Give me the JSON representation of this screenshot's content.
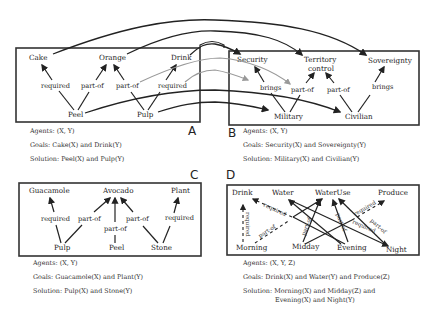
{
  "panels": {
    "A": {
      "letter": "A",
      "nodes": {
        "cake": "Cake",
        "orange": "Orange",
        "drink": "Drink",
        "peel": "Peel",
        "pulp": "Pulp"
      },
      "edges": [
        {
          "from": "Peel",
          "to": "Cake",
          "label": "required"
        },
        {
          "from": "Peel",
          "to": "Orange",
          "label": "part-of"
        },
        {
          "from": "Pulp",
          "to": "Orange",
          "label": "part-of"
        },
        {
          "from": "Pulp",
          "to": "Drink",
          "label": "required"
        }
      ],
      "agents": "Agents: (X, Y)",
      "goals": "Goals: Cake(X) and Drink(Y)",
      "solution": "Solution: Peel(X) and Pulp(Y)"
    },
    "B": {
      "letter": "B",
      "nodes": {
        "security": "Security",
        "territory_line1": "Territory",
        "territory_line2": "control",
        "sovereignty": "Sovereignty",
        "military": "Military",
        "civilian": "Civilian"
      },
      "edges": [
        {
          "from": "Military",
          "to": "Security",
          "label": "brings"
        },
        {
          "from": "Military",
          "to": "Territory control",
          "label": "part-of"
        },
        {
          "from": "Civilian",
          "to": "Territory control",
          "label": "part-of"
        },
        {
          "from": "Civilian",
          "to": "Sovereignty",
          "label": "brings"
        }
      ],
      "agents": "Agents: (X, Y)",
      "goals": "Goals: Security(X) and Sovereignty(Y)",
      "solution": "Solution: Military(X) and Civilian(Y)"
    },
    "C": {
      "letter": "C",
      "nodes": {
        "guacamole": "Guacamole",
        "avocado": "Avocado",
        "plant": "Plant",
        "pulp": "Pulp",
        "peel": "Peel",
        "stone": "Stone"
      },
      "edges": [
        {
          "from": "Pulp",
          "to": "Guacamole",
          "label": "required"
        },
        {
          "from": "Pulp",
          "to": "Avocado",
          "label": "part-of"
        },
        {
          "from": "Peel",
          "to": "Avocado",
          "label": "part-of"
        },
        {
          "from": "Stone",
          "to": "Avocado",
          "label": "part-of"
        },
        {
          "from": "Stone",
          "to": "Plant",
          "label": "required"
        }
      ],
      "agents": "Agents: (X, Y)",
      "goals": "Goals: Guacamole(X) and Plant(Y)",
      "solution": "Solution: Pulp(X) and Stone(Y)"
    },
    "D": {
      "letter": "D",
      "nodes": {
        "drink": "Drink",
        "water": "Water",
        "wateruse": "WaterUse",
        "produce": "Produce",
        "morning": "Morning",
        "midday": "Midday",
        "evening": "Evening",
        "night": "Night"
      },
      "edge_labels": {
        "required": "required",
        "part_of": "part-of"
      },
      "agents": "Agents: (X, Y, Z)",
      "goals": "Goals: Drink(X) and Water(Y) and Produce(Z)",
      "solution_line1": "Solution: Morning(X) and Midday(Z) and",
      "solution_line2": "Evening(X) and Night(Y)"
    }
  },
  "colors": {
    "line": "#222222",
    "mapping_gray": "#999999",
    "background": "#ffffff"
  }
}
